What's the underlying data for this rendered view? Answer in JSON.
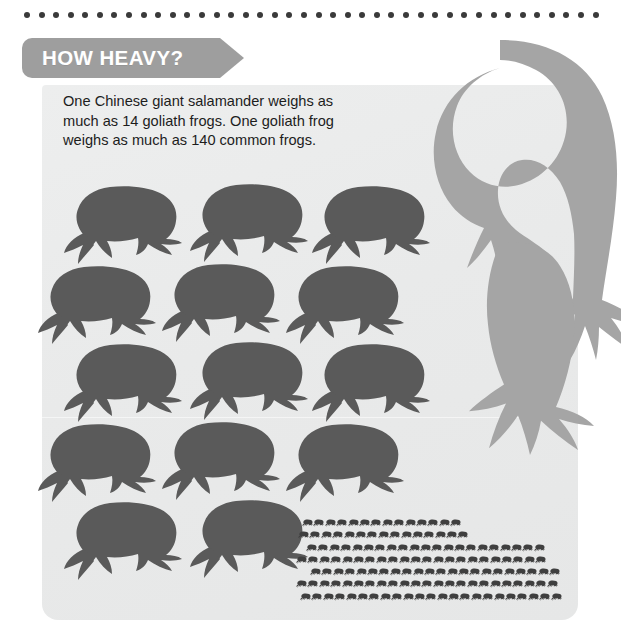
{
  "figure": {
    "title": "HOW HEAVY?",
    "caption_lines": [
      "One Chinese giant salamander weighs as",
      "much as 14 goliath frogs. One goliath frog",
      "weighs as much as 140 common frogs."
    ]
  },
  "colors": {
    "frog": "#5a5a5a",
    "mini_frog": "#3f3f3f",
    "salamander": "#a5a5a5",
    "banner": "#9e9e9e",
    "banner_text": "#ffffff",
    "panel": "#eaeaea",
    "dot_rule": "#3a3a3a",
    "body_text": "#1d1d1d",
    "page": "#ffffff"
  },
  "chart_data": {
    "type": "pictogram",
    "title": "HOW HEAVY?",
    "subtitle": "One Chinese giant salamander weighs as much as 14 goliath frogs. One goliath frog weighs as much as 140 common frogs.",
    "xlabel": "",
    "ylabel": "",
    "legend_position": "none",
    "grid": false,
    "unit_note": "Each silhouette represents one animal; relative body size encodes weight.",
    "series": [
      {
        "name": "Chinese giant salamander",
        "icon": "salamander-silhouette",
        "count": 1,
        "values": [
          1
        ],
        "equivalent_in": "goliath frogs",
        "equivalent_value": 14
      },
      {
        "name": "Goliath frog",
        "icon": "frog-silhouette",
        "count": 14,
        "values": [
          14
        ],
        "rows": [
          3,
          3,
          3,
          3,
          2
        ],
        "equivalent_in": "common frogs",
        "equivalent_value": 140
      },
      {
        "name": "Common frog",
        "icon": "mini-frog-silhouette",
        "count": 140,
        "values": [
          140
        ],
        "rows": [
          14,
          15,
          21,
          22,
          22,
          23,
          23
        ]
      }
    ],
    "annotations": [
      "1 Chinese giant salamander = 14 goliath frogs",
      "1 goliath frog = 140 common frogs"
    ]
  },
  "decor": {
    "dot_count": 40,
    "dot_rule_label": "dotted-divider"
  },
  "icons": {
    "salamander": "salamander-silhouette-icon",
    "frog": "frog-silhouette-icon",
    "mini_frog": "mini-frog-silhouette-icon",
    "dot": "dot-icon"
  }
}
